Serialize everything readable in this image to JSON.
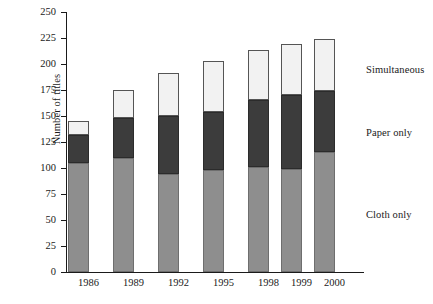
{
  "chart_data": {
    "type": "bar",
    "subtype": "stacked-bar",
    "title": "",
    "xlabel": "",
    "ylabel": "Number of titles",
    "categories": [
      "1986",
      "1989",
      "1992",
      "1995",
      "1998",
      "1999",
      "2000"
    ],
    "series": [
      {
        "name": "Cloth only",
        "color": "#8e8e8e",
        "values": [
          105,
          110,
          94,
          98,
          101,
          99,
          115
        ]
      },
      {
        "name": "Paper only",
        "color": "#3c3c3c",
        "values": [
          27,
          38,
          56,
          56,
          64,
          71,
          59
        ]
      },
      {
        "name": "Simultaneous",
        "color": "#f2f2f2",
        "values": [
          13,
          27,
          41,
          49,
          48,
          49,
          50
        ]
      }
    ],
    "cumulative_tops": {
      "cloth_only": [
        105,
        110,
        94,
        98,
        101,
        99,
        115
      ],
      "through_paper": [
        132,
        148,
        150,
        154,
        165,
        170,
        174
      ],
      "total": [
        145,
        175,
        191,
        203,
        213,
        219,
        224
      ]
    },
    "ylim": [
      0,
      250
    ],
    "yticks": [
      0,
      25,
      50,
      75,
      100,
      125,
      150,
      175,
      200,
      225,
      250
    ],
    "ytick_labels": [
      "0",
      "25",
      "50",
      "75",
      "100",
      "125",
      "150",
      "175",
      "200",
      "225",
      "250"
    ],
    "grid": false,
    "legend_position": "right-inline",
    "legend_entries": [
      "Simultaneous",
      "Paper only",
      "Cloth only"
    ],
    "annotations": []
  },
  "legend": {
    "simultaneous": "Simultaneous",
    "paper_only": "Paper only",
    "cloth_only": "Cloth only"
  }
}
